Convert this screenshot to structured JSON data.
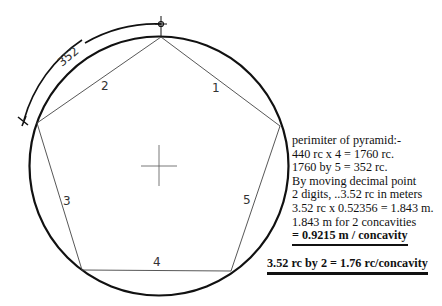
{
  "diagram": {
    "circle": {
      "cx": 159,
      "cy": 166,
      "r": 129
    },
    "pentagon_vertices": [
      [
        161,
        37
      ],
      [
        280,
        126
      ],
      [
        231,
        271
      ],
      [
        82,
        270
      ],
      [
        37,
        123
      ]
    ],
    "side_labels": [
      {
        "text": "1",
        "x": 212,
        "y": 92
      },
      {
        "text": "2",
        "x": 101,
        "y": 90
      },
      {
        "text": "3",
        "x": 63,
        "y": 205
      },
      {
        "text": "4",
        "x": 153,
        "y": 266
      },
      {
        "text": "5",
        "x": 243,
        "y": 204
      }
    ],
    "arc_dimension_label": "352",
    "center_mark": {
      "x": 159,
      "y": 166
    }
  },
  "notes": {
    "lines": [
      "perimiter of pyramid:-",
      "440 rc x 4 =  1760 rc.",
      "1760 by  5 =   352 rc.",
      "By moving decimal point",
      "2 digits, ..3.52 rc in meters",
      "3.52 rc x 0.52356 = 1.843 m.",
      "1.843 m for 2 concavities"
    ],
    "result": "= 0.9215 m / concavity",
    "summary": "3.52 rc by 2 = 1.76 rc/concavity"
  }
}
